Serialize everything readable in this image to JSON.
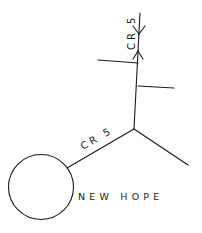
{
  "map": {
    "town": {
      "name": "NEW HOPE"
    },
    "roads": [
      {
        "id": "cr5-north",
        "label": "CR 5"
      },
      {
        "id": "cr5-southwest",
        "label": "CR 5"
      }
    ],
    "colors": {
      "line": "#1a1a1a",
      "background": "#ffffff"
    }
  }
}
